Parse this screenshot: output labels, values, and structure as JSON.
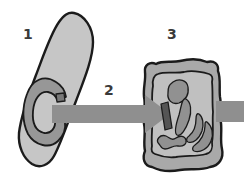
{
  "figure": {
    "type": "biological-diagram",
    "labels": {
      "cell1": "1",
      "transfer_arrow": "2",
      "cell2": "3"
    },
    "colors": {
      "background": "#ffffff",
      "outline": "#1b1b1b",
      "cell1_fill": "#c6c6c6",
      "ring_fill": "#979797",
      "particle_fill": "#787878",
      "arrow_fill": "#8f8f8f",
      "cell2_wall_fill": "#a9a9a9",
      "cell2_cytoplasm_fill": "#c0c0c0",
      "organelle_fill": "#919191",
      "rod_fill": "#555555",
      "label_color": "#3a3a3a"
    }
  }
}
